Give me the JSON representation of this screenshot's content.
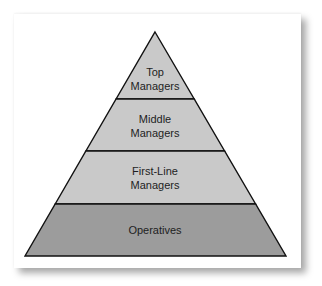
{
  "diagram": {
    "type": "pyramid",
    "title": "",
    "layers": [
      {
        "line1": "Top",
        "line2": "Managers",
        "fill": "#c9c9c9"
      },
      {
        "line1": "Middle",
        "line2": "Managers",
        "fill": "#c9c9c9"
      },
      {
        "line1": "First-Line",
        "line2": "Managers",
        "fill": "#c9c9c9"
      },
      {
        "line1": "Operatives",
        "line2": "",
        "fill": "#9c9c9c"
      }
    ],
    "outline_color": "#111111"
  }
}
